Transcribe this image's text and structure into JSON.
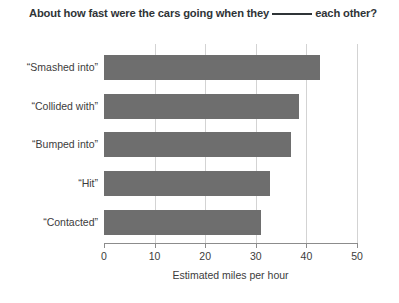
{
  "chart_data": {
    "type": "bar",
    "orientation": "horizontal",
    "title_parts": {
      "before_blank": "About how fast were the cars going when they",
      "blank": "_______",
      "after_blank": "each other?"
    },
    "categories": [
      "“Smashed into”",
      "“Collided with”",
      "“Bumped into”",
      "“Hit”",
      "“Contacted”"
    ],
    "values": [
      42.7,
      38.5,
      37.0,
      32.8,
      31.0
    ],
    "xlabel": "Estimated miles per hour",
    "ylabel": "",
    "xlim": [
      0,
      50
    ],
    "xticks": [
      0,
      10,
      20,
      30,
      40,
      50
    ],
    "xtick_labels": [
      "0",
      "10",
      "20",
      "30",
      "40",
      "50"
    ],
    "grid": "vertical",
    "legend": null,
    "bar_color": "#6e6e6e",
    "gridline_color": "#d3d3d3",
    "axis_color": "#8c8c8c",
    "text_color": "#3c3c3c",
    "title_color": "#2f3437",
    "background": "#ffffff"
  }
}
